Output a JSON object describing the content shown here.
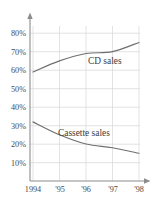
{
  "chart_data": {
    "type": "line",
    "title": "",
    "subtitle": "",
    "xlabel": "",
    "ylabel": "",
    "x": [
      "1994",
      "1995",
      "1996",
      "1997",
      "1998"
    ],
    "categories": [
      "1994",
      "'95",
      "'96",
      "'97",
      "'98"
    ],
    "series": [
      {
        "name": "CD sales",
        "values": [
          59,
          65,
          69,
          70,
          75
        ]
      },
      {
        "name": "Cassette sales",
        "values": [
          32,
          25,
          20,
          18,
          15
        ]
      }
    ],
    "ylim": [
      0,
      85
    ],
    "xlim": [
      1994,
      1998
    ],
    "yticks": [
      10,
      20,
      30,
      40,
      50,
      60,
      70,
      80
    ],
    "ytick_labels": [
      "10%",
      "20%",
      "30%",
      "40%",
      "50%",
      "60%",
      "70%",
      "80%"
    ],
    "xtick_labels": [
      "1994",
      "'95",
      "'96",
      "'97",
      "'98"
    ],
    "grid": true,
    "legend": "inline-annotations",
    "annotations": [
      {
        "text": "CD sales",
        "x": "'96",
        "y": 66
      },
      {
        "text": "Cassette sales",
        "x": "'96",
        "y": 24
      }
    ],
    "colors": {
      "line": "#6f6f6f",
      "grid": "#d7d7d7",
      "axis": "#8c8c8c",
      "text": "#4a4a4a",
      "background": "#ffffff"
    }
  },
  "axes": {
    "y_ticks": [
      {
        "label": "80%",
        "value": 80
      },
      {
        "label": "70%",
        "value": 70
      },
      {
        "label": "60%",
        "value": 60
      },
      {
        "label": "50%",
        "value": 50
      },
      {
        "label": "40%",
        "value": 40
      },
      {
        "label": "30%",
        "value": 30
      },
      {
        "label": "20%",
        "value": 20
      },
      {
        "label": "10%",
        "value": 10
      }
    ],
    "x_ticks": [
      {
        "label": "1994"
      },
      {
        "label": "'95"
      },
      {
        "label": "'96"
      },
      {
        "label": "'97"
      },
      {
        "label": "'98"
      }
    ]
  },
  "labels": {
    "cd": "CD sales",
    "cassette": "Cassette sales"
  }
}
